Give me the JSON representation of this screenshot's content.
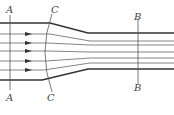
{
  "diagram": {
    "labels": {
      "A_top": "A",
      "A_bottom": "A",
      "C_top": "C",
      "C_bottom": "C",
      "B_top": "B",
      "B_bottom": "B"
    },
    "sections": [
      {
        "name": "A",
        "x": 10,
        "type": "straight cross-section"
      },
      {
        "name": "C",
        "type": "curved cross-section"
      },
      {
        "name": "B",
        "x": 138,
        "type": "straight cross-section"
      }
    ],
    "streamlines_left_y": [
      23,
      34,
      43,
      51,
      61,
      70,
      80
    ],
    "streamlines_right_y": [
      33,
      41,
      45,
      52,
      58,
      63,
      69
    ],
    "arrows_count": 5,
    "colors": {
      "wall": "#333333",
      "streamline": "#666666",
      "section": "#555555"
    }
  }
}
